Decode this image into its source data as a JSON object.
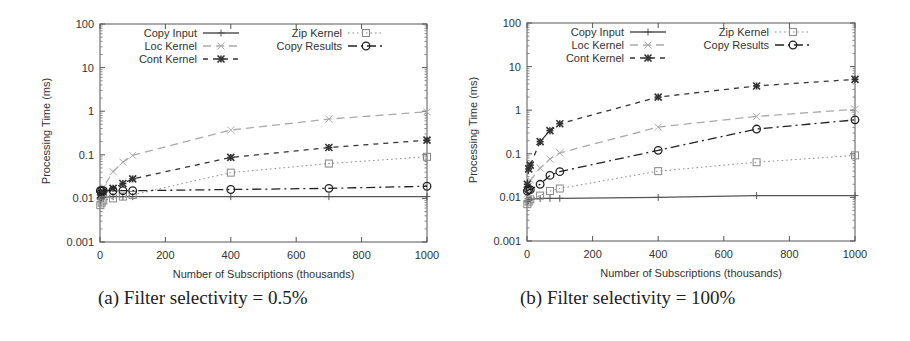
{
  "chart_data": [
    {
      "type": "line",
      "panel": "a",
      "caption": "(a) Filter selectivity = 0.5%",
      "title": "",
      "xlabel": "Number of Subscriptions (thousands)",
      "ylabel": "Processing Time (ms)",
      "xlim": [
        0,
        1000
      ],
      "ylim": [
        0.001,
        100
      ],
      "yscale": "log",
      "xticks": [
        "0",
        "200",
        "400",
        "600",
        "800",
        "1000"
      ],
      "yticks": [
        "0.001",
        "0.01",
        "0.1",
        "1",
        "10",
        "100"
      ],
      "grid": false,
      "legend_position": "top, two columns",
      "x": [
        1,
        5,
        10,
        40,
        70,
        100,
        400,
        700,
        1000
      ],
      "series": [
        {
          "name": "Copy Input",
          "marker": "+",
          "style": "solid",
          "color": "#555555",
          "values": [
            0.0095,
            0.01,
            0.0105,
            0.011,
            0.011,
            0.011,
            0.011,
            0.011,
            0.011
          ]
        },
        {
          "name": "Loc Kernel",
          "marker": "x",
          "style": "long-dash",
          "color": "#aaaaaa",
          "values": [
            0.012,
            0.015,
            0.018,
            0.041,
            0.068,
            0.097,
            0.37,
            0.66,
            0.97
          ]
        },
        {
          "name": "Cont Kernel",
          "marker": "*",
          "style": "dashed",
          "color": "#333333",
          "values": [
            0.012,
            0.013,
            0.014,
            0.017,
            0.022,
            0.028,
            0.087,
            0.147,
            0.217
          ]
        },
        {
          "name": "Zip Kernel",
          "marker": "square",
          "style": "dotted",
          "color": "#888888",
          "values": [
            0.007,
            0.008,
            0.009,
            0.01,
            0.011,
            0.012,
            0.039,
            0.063,
            0.09
          ]
        },
        {
          "name": "Copy Results",
          "marker": "circle",
          "style": "dash-dot",
          "color": "#222222",
          "values": [
            0.015,
            0.015,
            0.015,
            0.015,
            0.015,
            0.015,
            0.016,
            0.017,
            0.019
          ]
        }
      ]
    },
    {
      "type": "line",
      "panel": "b",
      "caption": "(b) Filter selectivity = 100%",
      "title": "",
      "xlabel": "Number of Subscriptions (thousands)",
      "ylabel": "Processing Time (ms)",
      "xlim": [
        0,
        1000
      ],
      "ylim": [
        0.001,
        100
      ],
      "yscale": "log",
      "xticks": [
        "0",
        "200",
        "400",
        "600",
        "800",
        "1000"
      ],
      "yticks": [
        "0.001",
        "0.01",
        "0.1",
        "1",
        "10",
        "100"
      ],
      "grid": false,
      "legend_position": "top, two columns",
      "x": [
        1,
        5,
        10,
        40,
        70,
        100,
        400,
        700,
        1000
      ],
      "series": [
        {
          "name": "Copy Input",
          "marker": "+",
          "style": "solid",
          "color": "#555555",
          "values": [
            0.008,
            0.0085,
            0.009,
            0.0095,
            0.0095,
            0.0095,
            0.01,
            0.011,
            0.011
          ]
        },
        {
          "name": "Loc Kernel",
          "marker": "x",
          "style": "long-dash",
          "color": "#aaaaaa",
          "values": [
            0.012,
            0.018,
            0.025,
            0.047,
            0.076,
            0.105,
            0.41,
            0.72,
            1.05
          ]
        },
        {
          "name": "Cont Kernel",
          "marker": "*",
          "style": "dashed",
          "color": "#333333",
          "values": [
            0.02,
            0.045,
            0.055,
            0.19,
            0.34,
            0.49,
            2.0,
            3.6,
            5.1
          ]
        },
        {
          "name": "Zip Kernel",
          "marker": "square",
          "style": "dotted",
          "color": "#888888",
          "values": [
            0.007,
            0.008,
            0.009,
            0.011,
            0.014,
            0.016,
            0.04,
            0.064,
            0.092
          ]
        },
        {
          "name": "Copy Results",
          "marker": "circle",
          "style": "dash-dot",
          "color": "#222222",
          "values": [
            0.014,
            0.015,
            0.015,
            0.02,
            0.032,
            0.039,
            0.12,
            0.37,
            0.6
          ]
        }
      ]
    }
  ],
  "panels": {
    "a": {
      "caption": "(a) Filter selectivity = 0.5%"
    },
    "b": {
      "caption": "(b) Filter selectivity = 100%"
    }
  }
}
